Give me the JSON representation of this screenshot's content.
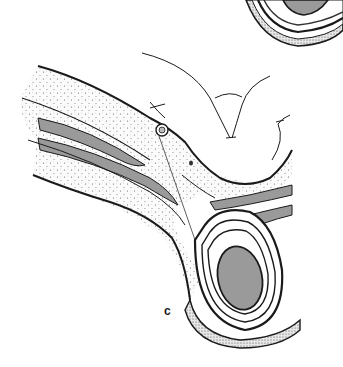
{
  "figure": {
    "panel_label": "c",
    "colors": {
      "background": "#ffffff",
      "outline": "#1a1a1a",
      "gray_fill": "#9a9a9a",
      "stipple": "#555555"
    },
    "elements": [
      "top-right-partial-testis-section",
      "abdominal-wall-layers",
      "peritoneal-fold-arrows",
      "spermatic-cord-layers",
      "vessel-cross-section",
      "testis-with-tunics"
    ]
  }
}
